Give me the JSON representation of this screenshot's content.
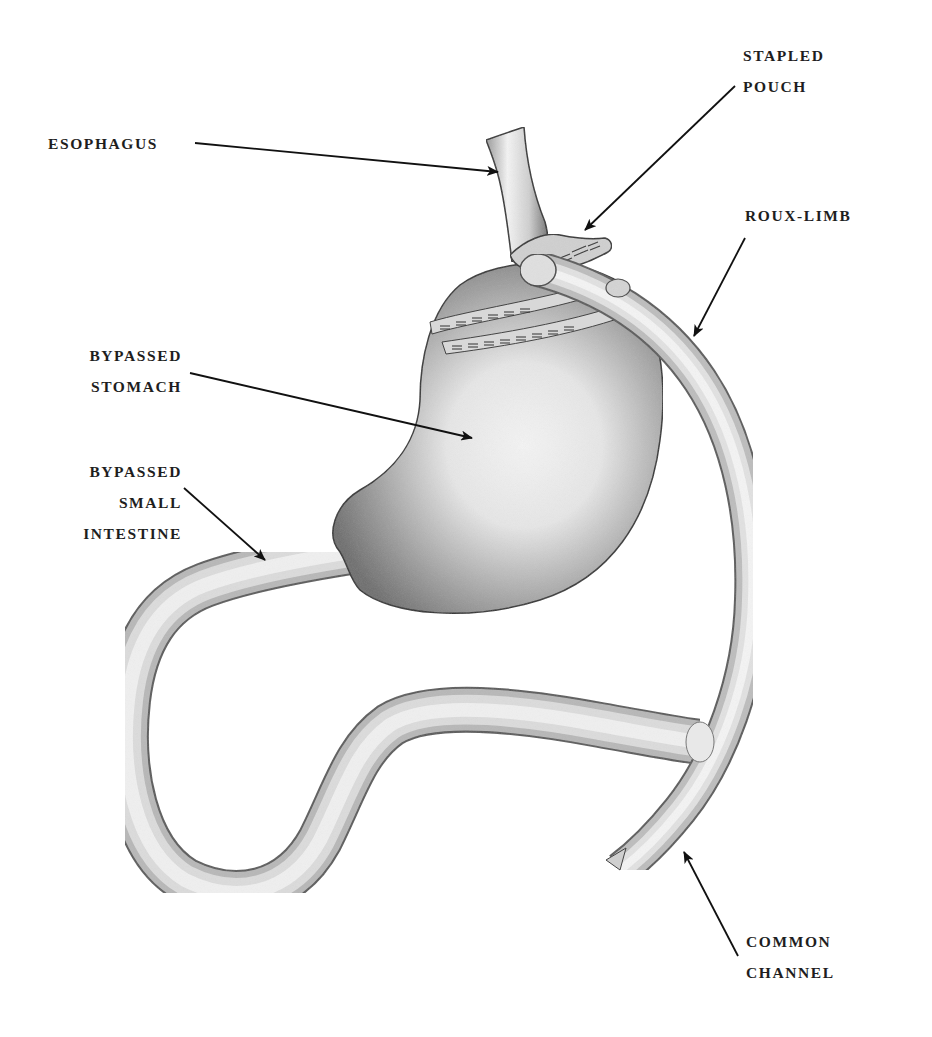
{
  "diagram": {
    "colors": {
      "background": "#ffffff",
      "label_text": "#1e1e1e",
      "leader_line": "#111111",
      "organ_light": "#f2f2f2",
      "organ_mid": "#c4c4c4",
      "organ_dark": "#6a6a6a"
    },
    "labels": {
      "esophagus": {
        "lines": [
          "ESOPHAGUS"
        ]
      },
      "stapled_pouch": {
        "lines": [
          "STAPLED",
          "POUCH"
        ]
      },
      "roux_limb": {
        "lines": [
          "ROUX-LIMB"
        ]
      },
      "bypassed_stomach": {
        "lines": [
          "BYPASSED",
          "STOMACH"
        ]
      },
      "bypassed_small_intestine": {
        "lines": [
          "BYPASSED",
          "SMALL",
          "INTESTINE"
        ]
      },
      "common_channel": {
        "lines": [
          "COMMON",
          "CHANNEL"
        ]
      }
    },
    "structures": [
      "esophagus-icon",
      "stapled-pouch-icon",
      "staple-lines-icon",
      "bypassed-stomach-icon",
      "roux-limb-icon",
      "bypassed-small-intestine-icon",
      "common-channel-icon"
    ]
  }
}
